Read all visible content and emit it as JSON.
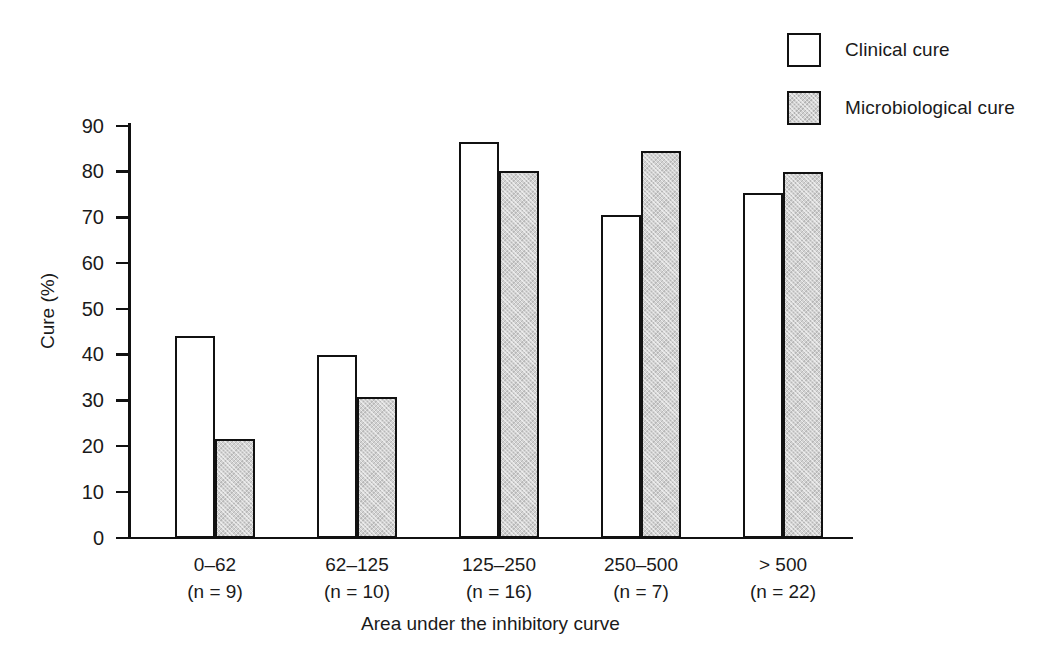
{
  "chart_data": {
    "type": "bar",
    "title": "",
    "xlabel": "Area under the inhibitory curve",
    "ylabel": "Cure (%)",
    "ylim": [
      0,
      90
    ],
    "yticks": [
      0,
      10,
      20,
      30,
      40,
      50,
      60,
      70,
      80,
      90
    ],
    "grid": false,
    "legend_position": "top-right",
    "categories": [
      "0–62",
      "62–125",
      "125–250",
      "250–500",
      "> 500"
    ],
    "category_sublabels": [
      "(n = 9)",
      "(n = 10)",
      "(n = 16)",
      "(n = 7)",
      "(n = 22)"
    ],
    "series": [
      {
        "name": "Clinical cure",
        "color": "#ffffff",
        "values": [
          44.1,
          39.8,
          86.5,
          70.4,
          75.2
        ]
      },
      {
        "name": "Microbiological cure",
        "color": "#d2d2d2",
        "values": [
          21.5,
          30.7,
          80.1,
          84.5,
          79.8
        ]
      }
    ]
  },
  "legend": {
    "items": [
      {
        "label": "Clinical cure",
        "style": "clinical"
      },
      {
        "label": "Microbiological cure",
        "style": "micro"
      }
    ]
  },
  "axes": {
    "y_title": "Cure (%)",
    "x_title": "Area under the inhibitory curve",
    "y_tick_labels": [
      "0",
      "10",
      "20",
      "30",
      "40",
      "50",
      "60",
      "70",
      "80",
      "90"
    ]
  },
  "colors": {
    "axis": "#111111",
    "bar_outline": "#111111",
    "clinical_fill": "#ffffff",
    "micro_fill": "#d2d2d2",
    "text": "#1a1a1a",
    "background": "#ffffff"
  }
}
